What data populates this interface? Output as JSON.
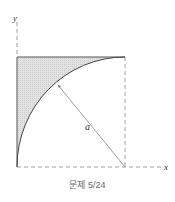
{
  "figure": {
    "axis_x_label": "x",
    "axis_y_label": "y",
    "radius_label": "a",
    "caption": "문제 5/24"
  },
  "colors": {
    "shade": "#dcdcdc",
    "line": "#555555",
    "dash": "#888888"
  }
}
